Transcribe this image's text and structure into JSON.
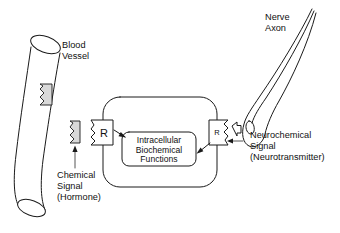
{
  "figure": {
    "background_color": "#ffffff",
    "line_color": "#1a1a1a",
    "shading_color": "#d9d9d9"
  },
  "labels": {
    "blood_vessel": {
      "line1": "Blood",
      "line2": "Vessel"
    },
    "nerve_axon": {
      "line1": "Nerve",
      "line2": "Axon"
    },
    "chemical_signal": {
      "line1": "Chemical",
      "line2": "Signal",
      "line3": "(Hormone)"
    },
    "neurochemical_signal": {
      "line1": "Neurochemical",
      "line2": "Signal",
      "line3": "(Neurotransmitter)"
    },
    "intracellular": {
      "line1": "Intracellular",
      "line2": "Biochemical",
      "line3": "Functions"
    },
    "receptor_left": "R",
    "receptor_right": "R"
  },
  "elements": {
    "blood_vessel": {
      "name": "blood-vessel-tube",
      "description": "curved cylindrical tube at left"
    },
    "hormone_in_vessel": {
      "name": "hormone-molecule-in-vessel",
      "description": "shaded zigzag molecule inside vessel wall"
    },
    "hormone_free": {
      "name": "hormone-molecule-free",
      "description": "shaded zigzag molecule outside vessel"
    },
    "receptor_left": {
      "name": "receptor-hormone",
      "description": "membrane receptor box with zigzag binding site facing hormone"
    },
    "cell_body": {
      "name": "target-cell",
      "description": "large rounded rectangle representing the target cell"
    },
    "intracellular_box": {
      "name": "intracellular-functions-box",
      "description": "inner rounded rectangle"
    },
    "receptor_right": {
      "name": "receptor-neurotransmitter",
      "description": "membrane receptor box with binding site facing nerve terminal"
    },
    "nerve_axon": {
      "name": "nerve-axon-terminal",
      "description": "tapering axon ending in a synaptic bouton with vesicle"
    },
    "neurotransmitter": {
      "name": "neurotransmitter-molecule",
      "description": "small arrow-shaped molecule released into synapse"
    }
  }
}
